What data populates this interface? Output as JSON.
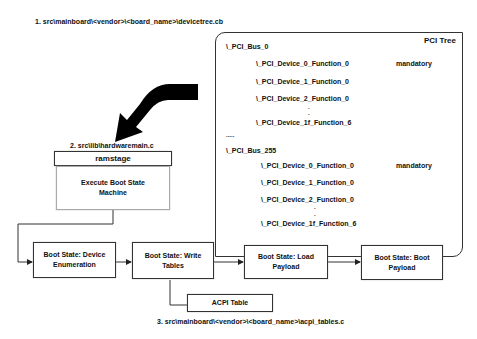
{
  "step1_label": "1. src\\mainboard\\<vendor>\\<board_name>\\devicetree.cb",
  "step2_label": "2. src\\lib\\hardwaremain.c",
  "step3_label": "3. src\\mainboard\\<vendor>\\<board_name>\\acpi_tables.c",
  "pci_tree": {
    "title": "PCI Tree",
    "bus0": {
      "label": "\\_PCI_Bus_0",
      "devices": [
        "\\_PCI_Device_0_Function_0",
        "\\_PCI_Device_1_Function_0",
        "\\_PCI_Device_2_Function_0",
        "\\_PCI_Device_1f_Function_6"
      ],
      "mandatory": "mandatory"
    },
    "ellipsis": ".....",
    "bus255": {
      "label": "\\_PCI_Bus_255",
      "devices": [
        "\\_PCI_Device_0_Function_0",
        "\\_PCI_Device_1_Function_0",
        "\\_PCI_Device_2_Function_0",
        "\\_PCI_Device_1f_Function_6"
      ],
      "mandatory": "mandatory"
    }
  },
  "ramstage": {
    "header": "ramstage",
    "body": "Execute Boot State Machine"
  },
  "boot_states": [
    "Boot State: Device Enumeration",
    "Boot State: Write Tables",
    "Boot State: Load Payload",
    "Boot State: Boot Payload"
  ],
  "acpi_table": "ACPI Table",
  "colors": {
    "line": "#333333",
    "arrow_fill": "#000000",
    "background": "#ffffff"
  }
}
